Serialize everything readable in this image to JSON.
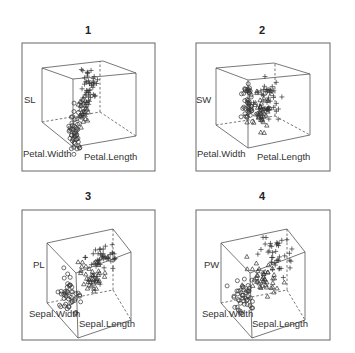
{
  "chart_data": [
    {
      "type": "scatter3d",
      "title": "1",
      "axes": {
        "x": "Petal.Length",
        "y": "Petal.Width",
        "z": "SL"
      },
      "z_label_full": "Sepal.Length",
      "markers": {
        "setosa": "circle",
        "versicolor": "triangle",
        "virginica": "plus"
      },
      "frame": [
        22,
        43,
        155,
        171
      ],
      "cube": {
        "top": [
          [
            42,
            68
          ],
          [
            103,
            61
          ],
          [
            136,
            73
          ],
          [
            73,
            79
          ]
        ],
        "front_bottom": [
          73,
          147
        ],
        "left_bottom": [
          42,
          122
        ],
        "right_bottom": [
          136,
          136
        ],
        "back_bottom": [
          100,
          112
        ],
        "back_top": [
          100,
          61
        ]
      },
      "clusters": [
        {
          "species": "setosa",
          "marker": "circle",
          "cx": 75,
          "cy": 132,
          "sx": 3,
          "sy": 11,
          "n": 45
        },
        {
          "species": "versicolor",
          "marker": "triangle",
          "cx": 83,
          "cy": 110,
          "sx": 3,
          "sy": 7,
          "n": 30
        },
        {
          "species": "virginica",
          "marker": "plus",
          "cx": 89,
          "cy": 86,
          "sx": 4,
          "sy": 11,
          "n": 45
        }
      ]
    },
    {
      "type": "scatter3d",
      "title": "2",
      "axes": {
        "x": "Petal.Length",
        "y": "Petal.Width",
        "z": "SW"
      },
      "z_label_full": "Sepal.Width",
      "markers": {
        "setosa": "circle",
        "versicolor": "triangle",
        "virginica": "plus"
      },
      "frame": [
        196,
        43,
        330,
        171
      ],
      "cube": {
        "top": [
          [
            216,
            68
          ],
          [
            274,
            63
          ],
          [
            310,
            74
          ],
          [
            248,
            80
          ]
        ],
        "front_bottom": [
          248,
          148
        ],
        "left_bottom": [
          216,
          125
        ],
        "right_bottom": [
          310,
          135
        ],
        "back_bottom": [
          275,
          116
        ],
        "back_top": [
          275,
          63
        ]
      },
      "clusters": [
        {
          "species": "setosa",
          "marker": "circle",
          "cx": 248,
          "cy": 104,
          "sx": 3,
          "sy": 12,
          "n": 45
        },
        {
          "species": "versicolor",
          "marker": "triangle",
          "cx": 261,
          "cy": 112,
          "sx": 4,
          "sy": 9,
          "n": 45
        },
        {
          "species": "virginica",
          "marker": "plus",
          "cx": 268,
          "cy": 100,
          "sx": 5,
          "sy": 11,
          "n": 40
        }
      ]
    },
    {
      "type": "scatter3d",
      "title": "3",
      "axes": {
        "x": "Sepal.Length",
        "y": "Sepal.Width",
        "z": "PL"
      },
      "z_label_full": "Petal.Length",
      "markers": {
        "setosa": "circle",
        "versicolor": "triangle",
        "virginica": "plus"
      },
      "frame": [
        22,
        210,
        155,
        340
      ],
      "cube": {
        "top": [
          [
            47,
            243
          ],
          [
            113,
            229
          ],
          [
            131,
            252
          ],
          [
            76,
            273
          ]
        ],
        "front_bottom": [
          78,
          338
        ],
        "left_bottom": [
          47,
          303
        ],
        "right_bottom": [
          131,
          320
        ],
        "back_bottom": [
          113,
          290
        ],
        "back_top": [
          113,
          229
        ]
      },
      "clusters": [
        {
          "species": "setosa",
          "marker": "circle",
          "cx": 70,
          "cy": 295,
          "sx": 6,
          "sy": 8,
          "n": 45
        },
        {
          "species": "versicolor",
          "marker": "triangle",
          "cx": 92,
          "cy": 275,
          "sx": 7,
          "sy": 7,
          "n": 45
        },
        {
          "species": "virginica",
          "marker": "plus",
          "cx": 104,
          "cy": 258,
          "sx": 9,
          "sy": 8,
          "n": 40
        }
      ]
    },
    {
      "type": "scatter3d",
      "title": "4",
      "axes": {
        "x": "Sepal.Length",
        "y": "Sepal.Width",
        "z": "PW"
      },
      "z_label_full": "Petal.Width",
      "markers": {
        "setosa": "circle",
        "versicolor": "triangle",
        "virginica": "plus"
      },
      "frame": [
        196,
        210,
        330,
        340
      ],
      "cube": {
        "top": [
          [
            221,
            243
          ],
          [
            287,
            229
          ],
          [
            305,
            252
          ],
          [
            250,
            273
          ]
        ],
        "front_bottom": [
          252,
          338
        ],
        "left_bottom": [
          221,
          303
        ],
        "right_bottom": [
          305,
          320
        ],
        "back_bottom": [
          287,
          290
        ],
        "back_top": [
          287,
          229
        ]
      },
      "clusters": [
        {
          "species": "setosa",
          "marker": "circle",
          "cx": 243,
          "cy": 294,
          "sx": 6,
          "sy": 9,
          "n": 45
        },
        {
          "species": "versicolor",
          "marker": "triangle",
          "cx": 265,
          "cy": 277,
          "sx": 8,
          "sy": 8,
          "n": 45
        },
        {
          "species": "virginica",
          "marker": "plus",
          "cx": 278,
          "cy": 256,
          "sx": 9,
          "sy": 9,
          "n": 40
        }
      ]
    }
  ],
  "panels": [
    {
      "title": "1",
      "z_label": "SL",
      "y_label": "Petal.Width",
      "x_label": "Petal.Length"
    },
    {
      "title": "2",
      "z_label": "SW",
      "y_label": "Petal.Width",
      "x_label": "Petal.Length"
    },
    {
      "title": "3",
      "z_label": "PL",
      "y_label": "Sepal.Width",
      "x_label": "Sepal.Length"
    },
    {
      "title": "4",
      "z_label": "PW",
      "y_label": "Sepal.Width",
      "x_label": "Sepal.Length"
    }
  ],
  "colors": {
    "line": "#555555",
    "marker": "#333333",
    "frame": "#666666"
  }
}
